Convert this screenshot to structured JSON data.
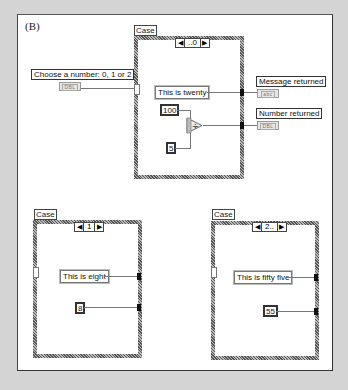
{
  "figure_label": "(B)",
  "controls": {
    "input": {
      "label": "Choose a number: 0, 1 or 2",
      "type": "DBL"
    }
  },
  "indicators": {
    "message": {
      "label": "Message returned",
      "type": "abc"
    },
    "number": {
      "label": "Number returned",
      "type": "DBL"
    }
  },
  "cases": [
    {
      "structure_label": "Case",
      "selector_value": "..0",
      "string_constant": "This is twenty",
      "numeric_constants": [
        "100",
        "5"
      ],
      "operator": "÷"
    },
    {
      "structure_label": "Case",
      "selector_value": "1",
      "string_constant": "This is eight",
      "numeric_constants": [
        "8"
      ]
    },
    {
      "structure_label": "Case",
      "selector_value": "2..",
      "string_constant": "This is fifty five",
      "numeric_constants": [
        "55"
      ]
    }
  ],
  "icons": {
    "left_arrow": "◀",
    "right_arrow": "▶"
  },
  "colors": {
    "background": "#d4d4d4",
    "panel": "#ffffff",
    "wire": "#777777",
    "frame": "#888888"
  }
}
